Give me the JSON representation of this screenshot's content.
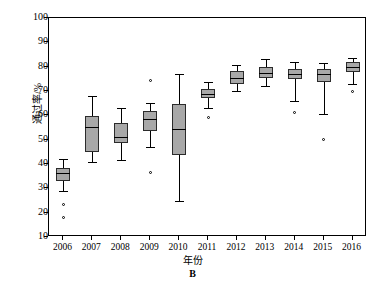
{
  "chart_data": {
    "type": "box",
    "title": "",
    "panel_letter": "B",
    "xlabel": "年份",
    "ylabel": "通过率/%",
    "ylim": [
      10,
      100
    ],
    "ytick_values": [
      10,
      20,
      30,
      40,
      50,
      60,
      70,
      80,
      90,
      100
    ],
    "ytick_labels": [
      "10",
      "20",
      "30",
      "40",
      "50",
      "60",
      "70",
      "80",
      "90",
      "100"
    ],
    "grid": false,
    "legend": "none",
    "categories": [
      "2006",
      "2007",
      "2008",
      "2009",
      "2010",
      "2011",
      "2012",
      "2013",
      "2014",
      "2015",
      "2016"
    ],
    "boxes": [
      {
        "category": "2006",
        "whisker_low": 29.0,
        "q1": 33.0,
        "median": 36.2,
        "q3": 38.5,
        "whisker_high": 42.0,
        "outliers": [
          23.5,
          18.0
        ]
      },
      {
        "category": "2007",
        "whisker_low": 40.8,
        "q1": 45.0,
        "median": 55.2,
        "q3": 59.7,
        "whisker_high": 68.0,
        "outliers": []
      },
      {
        "category": "2008",
        "whisker_low": 41.5,
        "q1": 48.8,
        "median": 51.0,
        "q3": 57.0,
        "whisker_high": 63.2,
        "outliers": []
      },
      {
        "category": "2009",
        "whisker_low": 47.0,
        "q1": 53.5,
        "median": 58.5,
        "q3": 61.8,
        "whisker_high": 65.0,
        "outliers": [
          74.2,
          36.5
        ]
      },
      {
        "category": "2010",
        "whisker_low": 24.8,
        "q1": 43.8,
        "median": 54.2,
        "q3": 64.5,
        "whisker_high": 77.0,
        "outliers": []
      },
      {
        "category": "2011",
        "whisker_low": 63.0,
        "q1": 67.0,
        "median": 68.8,
        "q3": 70.8,
        "whisker_high": 73.5,
        "outliers": [
          59.0
        ]
      },
      {
        "category": "2012",
        "whisker_low": 70.0,
        "q1": 73.0,
        "median": 75.5,
        "q3": 78.2,
        "whisker_high": 80.5,
        "outliers": []
      },
      {
        "category": "2013",
        "whisker_low": 72.0,
        "q1": 75.2,
        "median": 77.2,
        "q3": 79.8,
        "whisker_high": 83.0,
        "outliers": []
      },
      {
        "category": "2014",
        "whisker_low": 66.0,
        "q1": 75.0,
        "median": 77.0,
        "q3": 79.0,
        "whisker_high": 82.0,
        "outliers": [
          61.0
        ]
      },
      {
        "category": "2015",
        "whisker_low": 60.5,
        "q1": 73.8,
        "median": 76.8,
        "q3": 79.0,
        "whisker_high": 81.5,
        "outliers": [
          50.0
        ]
      },
      {
        "category": "2016",
        "whisker_low": 73.0,
        "q1": 78.0,
        "median": 80.0,
        "q3": 82.0,
        "whisker_high": 83.5,
        "outliers": [
          70.0
        ]
      }
    ]
  }
}
